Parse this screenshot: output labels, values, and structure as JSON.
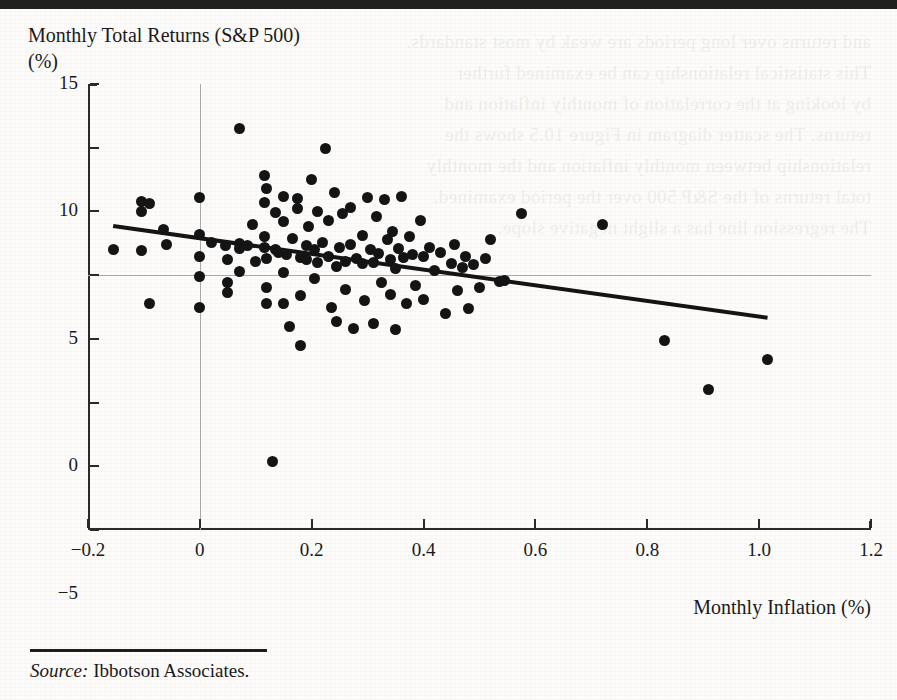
{
  "figure": {
    "title_line1": "Monthly Total Returns (S&P 500)",
    "title_line2": "(%)",
    "x_axis_title": "Monthly Inflation (%)",
    "source_label": "Source:",
    "source_text": "Ibbotson Associates."
  },
  "ghost_text": "and returns over long periods are weak by most standards.\nThis statistical relationship can be examined further\nby looking at the correlation of monthly inflation and\nreturns. The scatter diagram in Figure 10.5 shows the\nrelationship between monthly inflation and the monthly\ntotal returns of the S&P 500 over the period examined.\nThe regression line has a slight negative slope.",
  "chart_data": {
    "type": "scatter",
    "title": "Monthly Total Returns (S&P 500) (%)",
    "xlabel": "Monthly Inflation (%)",
    "ylabel": "Monthly Total Returns (S&P 500) (%)",
    "xlim": [
      -0.2,
      1.2
    ],
    "ylim": [
      -20,
      15
    ],
    "xticks": [
      -0.2,
      0,
      0.2,
      0.4,
      0.6,
      0.8,
      1.0,
      1.2
    ],
    "xticklabels": [
      "-0.2",
      "0",
      "0.2",
      "0.4",
      "0.6",
      "0.8",
      "1.0",
      "1.2"
    ],
    "yticks": [
      15,
      10,
      5,
      0,
      -5,
      -10,
      -15,
      -20
    ],
    "yticklabels": [
      "15",
      "10",
      "5",
      "0",
      "-5",
      "-10",
      "-15",
      "-20"
    ],
    "grid": false,
    "legend": null,
    "zero_lines": {
      "horizontal_y": 0,
      "vertical_x": 0
    },
    "trendline": {
      "type": "linear-regression",
      "x_start": -0.155,
      "y_start": 3.85,
      "x_end": 1.015,
      "y_end": -3.35
    },
    "points": [
      [
        -0.155,
        2.0
      ],
      [
        -0.105,
        5.8
      ],
      [
        -0.105,
        5.0
      ],
      [
        -0.105,
        1.9
      ],
      [
        -0.09,
        5.6
      ],
      [
        -0.09,
        -2.2
      ],
      [
        -0.065,
        3.6
      ],
      [
        -0.06,
        2.4
      ],
      [
        0.0,
        6.1
      ],
      [
        0.0,
        3.2
      ],
      [
        0.0,
        1.5
      ],
      [
        0.0,
        -0.1
      ],
      [
        0.0,
        -2.5
      ],
      [
        0.02,
        2.6
      ],
      [
        0.045,
        2.3
      ],
      [
        0.05,
        1.2
      ],
      [
        0.05,
        -0.6
      ],
      [
        0.05,
        -1.4
      ],
      [
        0.07,
        11.5
      ],
      [
        0.07,
        2.5
      ],
      [
        0.07,
        2.1
      ],
      [
        0.07,
        0.3
      ],
      [
        0.085,
        2.3
      ],
      [
        0.095,
        4.0
      ],
      [
        0.1,
        1.1
      ],
      [
        0.115,
        7.8
      ],
      [
        0.115,
        5.7
      ],
      [
        0.115,
        3.0
      ],
      [
        0.115,
        2.2
      ],
      [
        0.12,
        6.8
      ],
      [
        0.12,
        1.3
      ],
      [
        0.12,
        -1.0
      ],
      [
        0.12,
        -2.2
      ],
      [
        0.13,
        -14.6
      ],
      [
        0.135,
        4.9
      ],
      [
        0.135,
        2.0
      ],
      [
        0.14,
        1.8
      ],
      [
        0.15,
        6.2
      ],
      [
        0.15,
        4.2
      ],
      [
        0.15,
        0.2
      ],
      [
        0.15,
        -2.2
      ],
      [
        0.155,
        1.6
      ],
      [
        0.16,
        -4.0
      ],
      [
        0.165,
        2.9
      ],
      [
        0.175,
        6.0
      ],
      [
        0.175,
        5.2
      ],
      [
        0.18,
        1.4
      ],
      [
        0.18,
        -1.6
      ],
      [
        0.18,
        -5.5
      ],
      [
        0.19,
        2.3
      ],
      [
        0.19,
        1.2
      ],
      [
        0.195,
        3.8
      ],
      [
        0.2,
        7.5
      ],
      [
        0.205,
        2.0
      ],
      [
        0.205,
        -0.3
      ],
      [
        0.21,
        5.0
      ],
      [
        0.21,
        1.0
      ],
      [
        0.22,
        2.6
      ],
      [
        0.225,
        9.9
      ],
      [
        0.23,
        4.3
      ],
      [
        0.23,
        1.5
      ],
      [
        0.235,
        -2.5
      ],
      [
        0.24,
        6.5
      ],
      [
        0.245,
        0.7
      ],
      [
        0.245,
        -3.6
      ],
      [
        0.25,
        2.2
      ],
      [
        0.255,
        4.8
      ],
      [
        0.26,
        1.1
      ],
      [
        0.26,
        -1.1
      ],
      [
        0.27,
        5.3
      ],
      [
        0.27,
        2.4
      ],
      [
        0.275,
        -4.2
      ],
      [
        0.28,
        1.3
      ],
      [
        0.29,
        3.1
      ],
      [
        0.29,
        0.9
      ],
      [
        0.295,
        -2.0
      ],
      [
        0.3,
        6.1
      ],
      [
        0.305,
        2.0
      ],
      [
        0.31,
        1.0
      ],
      [
        0.31,
        -3.8
      ],
      [
        0.315,
        4.6
      ],
      [
        0.32,
        1.7
      ],
      [
        0.325,
        -0.6
      ],
      [
        0.33,
        5.9
      ],
      [
        0.335,
        2.8
      ],
      [
        0.34,
        1.2
      ],
      [
        0.34,
        -1.5
      ],
      [
        0.345,
        3.4
      ],
      [
        0.35,
        0.5
      ],
      [
        0.35,
        -4.3
      ],
      [
        0.355,
        2.1
      ],
      [
        0.36,
        6.2
      ],
      [
        0.365,
        1.4
      ],
      [
        0.37,
        -2.2
      ],
      [
        0.375,
        3.0
      ],
      [
        0.38,
        1.6
      ],
      [
        0.385,
        -0.8
      ],
      [
        0.395,
        4.3
      ],
      [
        0.4,
        1.5
      ],
      [
        0.4,
        -1.9
      ],
      [
        0.41,
        2.2
      ],
      [
        0.42,
        0.4
      ],
      [
        0.43,
        1.8
      ],
      [
        0.44,
        -3.0
      ],
      [
        0.45,
        0.9
      ],
      [
        0.455,
        2.4
      ],
      [
        0.46,
        -1.2
      ],
      [
        0.47,
        0.6
      ],
      [
        0.475,
        1.5
      ],
      [
        0.48,
        -2.6
      ],
      [
        0.49,
        0.8
      ],
      [
        0.5,
        -1.0
      ],
      [
        0.51,
        1.3
      ],
      [
        0.52,
        2.8
      ],
      [
        0.535,
        -0.5
      ],
      [
        0.545,
        -0.4
      ],
      [
        0.575,
        4.8
      ],
      [
        0.72,
        4.0
      ],
      [
        0.83,
        -5.1
      ],
      [
        0.91,
        -9.0
      ],
      [
        1.015,
        -6.6
      ]
    ]
  }
}
